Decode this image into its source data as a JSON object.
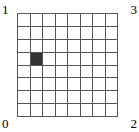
{
  "figure": {
    "corner_labels": {
      "top_left": "1",
      "top_right": "3",
      "bottom_left": "0",
      "bottom_right": "2"
    },
    "grid": {
      "columns": 8,
      "rows": 8,
      "line_color": "#555555",
      "cell_background": "#ffffff",
      "filled_cell_color": "#333333",
      "filled_cells": [
        {
          "row": 4,
          "column": 2
        }
      ]
    }
  },
  "chart_data": {
    "type": "heatmap",
    "title": "",
    "xlabel": "",
    "ylabel": "",
    "grid": true,
    "legend": "none",
    "columns": 8,
    "rows": 8,
    "categories": [
      "1",
      "2",
      "3",
      "4",
      "5",
      "6",
      "7",
      "8"
    ],
    "row_categories": [
      "1",
      "2",
      "3",
      "4",
      "5",
      "6",
      "7",
      "8"
    ],
    "corner_annotations": [
      {
        "position": "top-left",
        "text": "1"
      },
      {
        "position": "top-right",
        "text": "3"
      },
      {
        "position": "bottom-left",
        "text": "0"
      },
      {
        "position": "bottom-right",
        "text": "2"
      }
    ],
    "values": [
      [
        0,
        0,
        0,
        0,
        0,
        0,
        0,
        0
      ],
      [
        0,
        0,
        0,
        0,
        0,
        0,
        0,
        0
      ],
      [
        0,
        0,
        0,
        0,
        0,
        0,
        0,
        0
      ],
      [
        0,
        1,
        0,
        0,
        0,
        0,
        0,
        0
      ],
      [
        0,
        0,
        0,
        0,
        0,
        0,
        0,
        0
      ],
      [
        0,
        0,
        0,
        0,
        0,
        0,
        0,
        0
      ],
      [
        0,
        0,
        0,
        0,
        0,
        0,
        0,
        0
      ],
      [
        0,
        0,
        0,
        0,
        0,
        0,
        0,
        0
      ]
    ],
    "value_colors": {
      "0": "#ffffff",
      "1": "#333333"
    }
  }
}
